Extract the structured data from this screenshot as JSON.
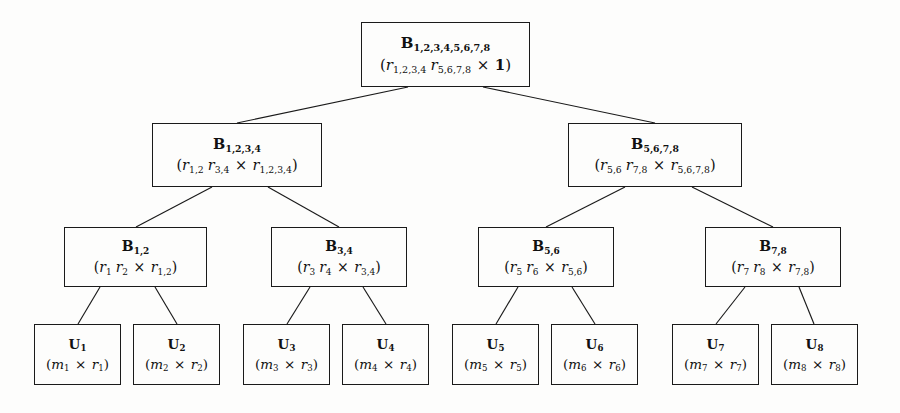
{
  "diagram": {
    "type": "binary-tree",
    "levels": 4,
    "background_color": "#fdfdfc",
    "line_color": "#1a1a1a",
    "text_color": "#111111"
  },
  "nodes": [
    {
      "id": "B12345678",
      "level": 0,
      "label": "B_{1,2,3,4,5,6,7,8}",
      "label_base": "B",
      "label_sub": "1,2,3,4,5,6,7,8",
      "dims": "(r_{1,2,3,4} r_{5,6,7,8} × 1)",
      "factors": [
        "r_{1,2,3,4}",
        "r_{5,6,7,8}"
      ],
      "dim_right": "1",
      "box": {
        "x": 361,
        "y": 22,
        "w": 169,
        "h": 65
      }
    },
    {
      "id": "B1234",
      "level": 1,
      "label": "B_{1,2,3,4}",
      "label_base": "B",
      "label_sub": "1,2,3,4",
      "dims": "(r_{1,2} r_{3,4} × r_{1,2,3,4})",
      "factors": [
        "r_{1,2}",
        "r_{3,4}"
      ],
      "dim_right": "r_{1,2,3,4}",
      "box": {
        "x": 152,
        "y": 123,
        "w": 170,
        "h": 64
      }
    },
    {
      "id": "B5678",
      "level": 1,
      "label": "B_{5,6,7,8}",
      "label_base": "B",
      "label_sub": "5,6,7,8",
      "dims": "(r_{5,6} r_{7,8} × r_{5,6,7,8})",
      "factors": [
        "r_{5,6}",
        "r_{7,8}"
      ],
      "dim_right": "r_{5,6,7,8}",
      "box": {
        "x": 568,
        "y": 123,
        "w": 174,
        "h": 64
      }
    },
    {
      "id": "B12",
      "level": 2,
      "label": "B_{1,2}",
      "label_base": "B",
      "label_sub": "1,2",
      "dims": "(r_1 r_2 × r_{1,2})",
      "factors": [
        "r_1",
        "r_2"
      ],
      "dim_right": "r_{1,2}",
      "box": {
        "x": 64,
        "y": 227,
        "w": 143,
        "h": 60
      }
    },
    {
      "id": "B34",
      "level": 2,
      "label": "B_{3,4}",
      "label_base": "B",
      "label_sub": "3,4",
      "dims": "(r_3 r_4 × r_{3,4})",
      "factors": [
        "r_3",
        "r_4"
      ],
      "dim_right": "r_{3,4}",
      "box": {
        "x": 271,
        "y": 227,
        "w": 136,
        "h": 60
      }
    },
    {
      "id": "B56",
      "level": 2,
      "label": "B_{5,6}",
      "label_base": "B",
      "label_sub": "5,6",
      "dims": "(r_5 r_6 × r_{5,6})",
      "factors": [
        "r_5",
        "r_6"
      ],
      "dim_right": "r_{5,6}",
      "box": {
        "x": 478,
        "y": 227,
        "w": 136,
        "h": 60
      }
    },
    {
      "id": "B78",
      "level": 2,
      "label": "B_{7,8}",
      "label_base": "B",
      "label_sub": "7,8",
      "dims": "(r_7 r_8 × r_{7,8})",
      "factors": [
        "r_7",
        "r_8"
      ],
      "dim_right": "r_{7,8}",
      "box": {
        "x": 705,
        "y": 227,
        "w": 136,
        "h": 60
      }
    },
    {
      "id": "U1",
      "level": 3,
      "label": "U_1",
      "label_base": "U",
      "label_sub": "1",
      "dims": "(m_1 × r_1)",
      "dim_left": "m_1",
      "dim_right": "r_1",
      "box": {
        "x": 34,
        "y": 324,
        "w": 87,
        "h": 61
      }
    },
    {
      "id": "U2",
      "level": 3,
      "label": "U_2",
      "label_base": "U",
      "label_sub": "2",
      "dims": "(m_2 × r_2)",
      "dim_left": "m_2",
      "dim_right": "r_2",
      "box": {
        "x": 133,
        "y": 324,
        "w": 87,
        "h": 61
      }
    },
    {
      "id": "U3",
      "level": 3,
      "label": "U_3",
      "label_base": "U",
      "label_sub": "3",
      "dims": "(m_3 × r_3)",
      "dim_left": "m_3",
      "dim_right": "r_3",
      "box": {
        "x": 243,
        "y": 324,
        "w": 87,
        "h": 61
      }
    },
    {
      "id": "U4",
      "level": 3,
      "label": "U_4",
      "label_base": "U",
      "label_sub": "4",
      "dims": "(m_4 × r_4)",
      "dim_left": "m_4",
      "dim_right": "r_4",
      "box": {
        "x": 342,
        "y": 324,
        "w": 87,
        "h": 61
      }
    },
    {
      "id": "U5",
      "level": 3,
      "label": "U_5",
      "label_base": "U",
      "label_sub": "5",
      "dims": "(m_5 × r_5)",
      "dim_left": "m_5",
      "dim_right": "r_5",
      "box": {
        "x": 452,
        "y": 324,
        "w": 87,
        "h": 61
      }
    },
    {
      "id": "U6",
      "level": 3,
      "label": "U_6",
      "label_base": "U",
      "label_sub": "6",
      "dims": "(m_6 × r_6)",
      "dim_left": "m_6",
      "dim_right": "r_6",
      "box": {
        "x": 551,
        "y": 324,
        "w": 87,
        "h": 61
      }
    },
    {
      "id": "U7",
      "level": 3,
      "label": "U_7",
      "label_base": "U",
      "label_sub": "7",
      "dims": "(m_7 × r_7)",
      "dim_left": "m_7",
      "dim_right": "r_7",
      "box": {
        "x": 672,
        "y": 324,
        "w": 87,
        "h": 61
      }
    },
    {
      "id": "U8",
      "level": 3,
      "label": "U_8",
      "label_base": "U",
      "label_sub": "8",
      "dims": "(m_8 × r_8)",
      "dim_left": "m_8",
      "dim_right": "r_8",
      "box": {
        "x": 771,
        "y": 324,
        "w": 87,
        "h": 61
      }
    }
  ],
  "edges": [
    {
      "from": "B12345678",
      "to": "B1234",
      "x1": 408,
      "y1": 87,
      "x2": 237,
      "y2": 123
    },
    {
      "from": "B12345678",
      "to": "B5678",
      "x1": 483,
      "y1": 87,
      "x2": 655,
      "y2": 123
    },
    {
      "from": "B1234",
      "to": "B12",
      "x1": 212,
      "y1": 187,
      "x2": 136,
      "y2": 227
    },
    {
      "from": "B1234",
      "to": "B34",
      "x1": 268,
      "y1": 187,
      "x2": 339,
      "y2": 227
    },
    {
      "from": "B5678",
      "to": "B56",
      "x1": 625,
      "y1": 187,
      "x2": 546,
      "y2": 227
    },
    {
      "from": "B5678",
      "to": "B78",
      "x1": 692,
      "y1": 187,
      "x2": 773,
      "y2": 227
    },
    {
      "from": "B12",
      "to": "U1",
      "x1": 100,
      "y1": 287,
      "x2": 78,
      "y2": 324
    },
    {
      "from": "B12",
      "to": "U2",
      "x1": 155,
      "y1": 287,
      "x2": 177,
      "y2": 324
    },
    {
      "from": "B34",
      "to": "U3",
      "x1": 310,
      "y1": 287,
      "x2": 287,
      "y2": 324
    },
    {
      "from": "B34",
      "to": "U4",
      "x1": 363,
      "y1": 287,
      "x2": 386,
      "y2": 324
    },
    {
      "from": "B56",
      "to": "U5",
      "x1": 518,
      "y1": 287,
      "x2": 496,
      "y2": 324
    },
    {
      "from": "B56",
      "to": "U6",
      "x1": 572,
      "y1": 287,
      "x2": 595,
      "y2": 324
    },
    {
      "from": "B78",
      "to": "U7",
      "x1": 745,
      "y1": 287,
      "x2": 716,
      "y2": 324
    },
    {
      "from": "B78",
      "to": "U8",
      "x1": 799,
      "y1": 287,
      "x2": 814,
      "y2": 324
    }
  ]
}
